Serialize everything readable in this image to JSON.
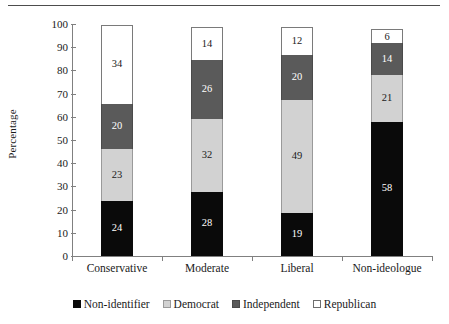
{
  "chart_data": {
    "type": "bar",
    "subtype": "stacked-bar",
    "title": "",
    "xlabel": "",
    "ylabel": "Percentage",
    "ylim": [
      0,
      100
    ],
    "yticks": [
      0,
      10,
      20,
      30,
      40,
      50,
      60,
      70,
      80,
      90,
      100
    ],
    "ytick_labels": [
      "0",
      "10",
      "20",
      "30",
      "40",
      "50",
      "60",
      "70",
      "80",
      "90",
      "100"
    ],
    "grid": false,
    "legend_position": "bottom",
    "stack_order_bottom_to_top": [
      "Non-identifier",
      "Democrat",
      "Independent",
      "Republican"
    ],
    "categories": [
      "Conservative",
      "Moderate",
      "Liberal",
      "Non-ideologue"
    ],
    "series": [
      {
        "name": "Non-identifier",
        "color": "#0a0a0a",
        "swatch": "sw-black",
        "segclass": "s-black",
        "values": [
          24,
          28,
          19,
          58
        ]
      },
      {
        "name": "Democrat",
        "color": "#d2d2d2",
        "swatch": "sw-lgray",
        "segclass": "s-lgray",
        "values": [
          23,
          32,
          49,
          21
        ]
      },
      {
        "name": "Independent",
        "color": "#5a5a5a",
        "swatch": "sw-dgray",
        "segclass": "s-dgray",
        "values": [
          20,
          26,
          20,
          14
        ]
      },
      {
        "name": "Republican",
        "color": "#ffffff",
        "swatch": "sw-white",
        "segclass": "s-white",
        "values": [
          34,
          14,
          12,
          6
        ]
      }
    ]
  },
  "legend": {
    "items": [
      {
        "label": "Non-identifier",
        "swatch": "sw-black"
      },
      {
        "label": "Democrat",
        "swatch": "sw-lgray"
      },
      {
        "label": "Independent",
        "swatch": "sw-dgray"
      },
      {
        "label": "Republican",
        "swatch": "sw-white"
      }
    ]
  }
}
